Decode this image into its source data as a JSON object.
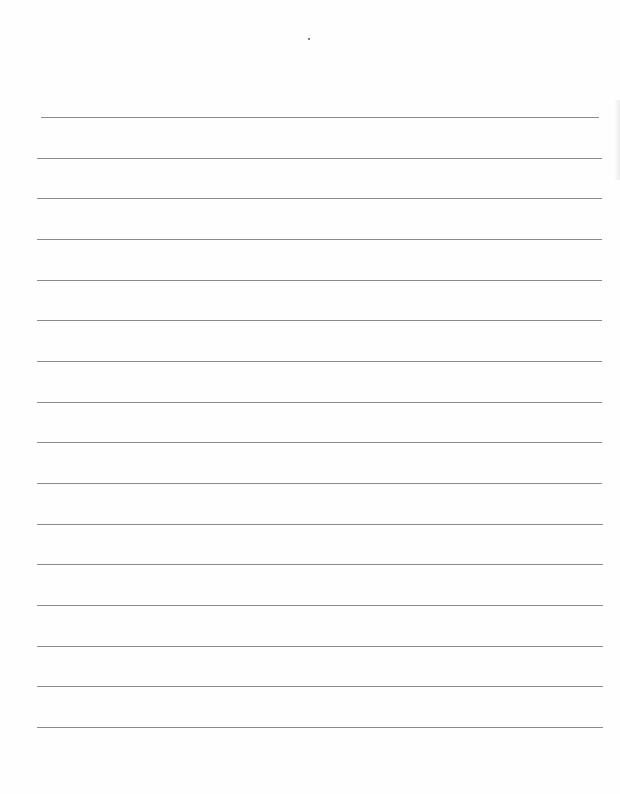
{
  "page": {
    "type": "blank lined writing paper",
    "background": "#fefefe",
    "rule_color": "#8a8a8a",
    "rule_count": 16,
    "rules": [
      {
        "y": 117,
        "x1": 41,
        "x2": 599
      },
      {
        "y": 158,
        "x1": 37,
        "x2": 602
      },
      {
        "y": 198,
        "x1": 37,
        "x2": 602
      },
      {
        "y": 239,
        "x1": 37,
        "x2": 602
      },
      {
        "y": 280,
        "x1": 37,
        "x2": 602
      },
      {
        "y": 320,
        "x1": 37,
        "x2": 602
      },
      {
        "y": 361,
        "x1": 37,
        "x2": 602
      },
      {
        "y": 402,
        "x1": 37,
        "x2": 602
      },
      {
        "y": 442,
        "x1": 37,
        "x2": 602
      },
      {
        "y": 483,
        "x1": 37,
        "x2": 602
      },
      {
        "y": 524,
        "x1": 37,
        "x2": 603
      },
      {
        "y": 564,
        "x1": 37,
        "x2": 603
      },
      {
        "y": 605,
        "x1": 37,
        "x2": 603
      },
      {
        "y": 646,
        "x1": 37,
        "x2": 603
      },
      {
        "y": 686,
        "x1": 37,
        "x2": 603
      },
      {
        "y": 727,
        "x1": 37,
        "x2": 603
      }
    ]
  }
}
